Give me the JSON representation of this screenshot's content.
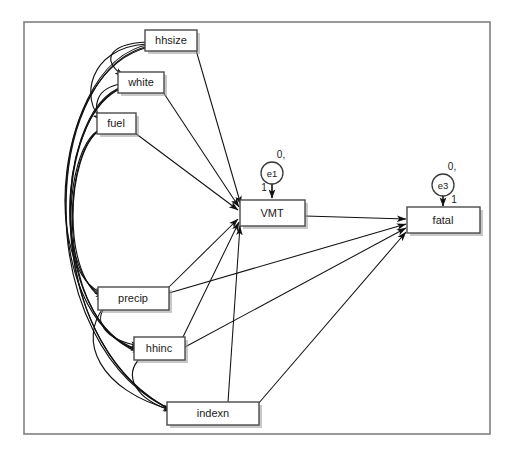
{
  "diagram": {
    "type": "sem-path-diagram",
    "title": "",
    "frame": {
      "x": 24,
      "y": 22,
      "width": 466,
      "height": 412
    },
    "observed_variables": [
      {
        "id": "hhsize",
        "label": "hhsize",
        "x": 145,
        "y": 30,
        "width": 52,
        "height": 21
      },
      {
        "id": "white",
        "label": "white",
        "x": 118,
        "y": 72,
        "width": 46,
        "height": 21
      },
      {
        "id": "fuel",
        "label": "fuel",
        "x": 97,
        "y": 113,
        "width": 39,
        "height": 21
      },
      {
        "id": "precip",
        "label": "precip",
        "x": 98,
        "y": 287,
        "width": 71,
        "height": 23
      },
      {
        "id": "hhinc",
        "label": "hhinc",
        "x": 134,
        "y": 337,
        "width": 51,
        "height": 23
      },
      {
        "id": "indexn",
        "label": "indexn",
        "x": 167,
        "y": 402,
        "width": 92,
        "height": 23
      }
    ],
    "endogenous_variables": [
      {
        "id": "VMT",
        "label": "VMT",
        "x": 240,
        "y": 200,
        "width": 65,
        "height": 26
      },
      {
        "id": "fatal",
        "label": "fatal",
        "x": 407,
        "y": 207,
        "width": 73,
        "height": 26
      }
    ],
    "error_terms": [
      {
        "id": "e1",
        "label": "e1",
        "cx": 272,
        "cy": 173,
        "r": 11,
        "mean_variance_label": "0,",
        "mean_variance_x": 279,
        "mean_variance_y": 155,
        "loading_label": "1",
        "loading_x": 264,
        "loading_y": 187,
        "target": "VMT"
      },
      {
        "id": "e3",
        "label": "e3",
        "cx": 443,
        "cy": 185,
        "r": 11,
        "mean_variance_label": "0,",
        "mean_variance_x": 450,
        "mean_variance_y": 167,
        "loading_label": "1",
        "loading_x": 453,
        "loading_y": 199,
        "target": "fatal"
      }
    ],
    "regression_paths": [
      {
        "from": "hhsize",
        "to": "VMT"
      },
      {
        "from": "white",
        "to": "VMT"
      },
      {
        "from": "fuel",
        "to": "VMT"
      },
      {
        "from": "precip",
        "to": "VMT"
      },
      {
        "from": "hhinc",
        "to": "VMT"
      },
      {
        "from": "indexn",
        "to": "VMT"
      },
      {
        "from": "VMT",
        "to": "fatal"
      },
      {
        "from": "precip",
        "to": "fatal"
      },
      {
        "from": "hhinc",
        "to": "fatal"
      },
      {
        "from": "indexn",
        "to": "fatal"
      }
    ],
    "covariance_paths": [
      {
        "between": [
          "hhsize",
          "white"
        ]
      },
      {
        "between": [
          "hhsize",
          "fuel"
        ]
      },
      {
        "between": [
          "hhsize",
          "precip"
        ]
      },
      {
        "between": [
          "hhsize",
          "hhinc"
        ]
      },
      {
        "between": [
          "hhsize",
          "indexn"
        ]
      },
      {
        "between": [
          "white",
          "fuel"
        ]
      },
      {
        "between": [
          "white",
          "precip"
        ]
      },
      {
        "between": [
          "white",
          "hhinc"
        ]
      },
      {
        "between": [
          "white",
          "indexn"
        ]
      },
      {
        "between": [
          "fuel",
          "precip"
        ]
      },
      {
        "between": [
          "fuel",
          "hhinc"
        ]
      },
      {
        "between": [
          "fuel",
          "indexn"
        ]
      },
      {
        "between": [
          "precip",
          "hhinc"
        ]
      },
      {
        "between": [
          "precip",
          "indexn"
        ]
      },
      {
        "between": [
          "hhinc",
          "indexn"
        ]
      }
    ],
    "colors": {
      "background": "#ffffff",
      "frame_stroke": "#808080",
      "box_stroke": "#4a4a4a",
      "box_fill": "#ffffff",
      "line": "#111111",
      "shadow": "#9a9a9a",
      "text": "#1a1a1a"
    }
  }
}
